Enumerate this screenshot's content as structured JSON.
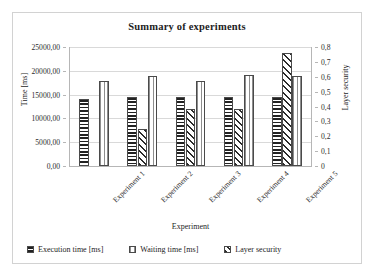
{
  "chart_data": {
    "type": "bar",
    "title": "Summary of experiments",
    "xlabel": "Experiment",
    "ylabel": "Time [ms]",
    "y2label": "Layer security",
    "categories": [
      "Experiment 1",
      "Experiment 2",
      "Experiment 3",
      "Experiment 4",
      "Experiment 5"
    ],
    "series": [
      {
        "name": "Execution time [ms]",
        "axis": "left",
        "pattern": "horizontal-stripes",
        "values": [
          14150,
          14400,
          14400,
          14500,
          14450
        ]
      },
      {
        "name": "Layer security",
        "axis": "right",
        "pattern": "diagonal-stripes",
        "values": [
          0.0,
          0.25,
          0.38,
          0.38,
          0.76
        ]
      },
      {
        "name": "Waiting time [ms]",
        "axis": "left",
        "pattern": "vertical-stripes",
        "values": [
          17850,
          19000,
          17850,
          19150,
          18950
        ]
      }
    ],
    "ylim": [
      0,
      25000
    ],
    "y2lim": [
      0,
      0.8
    ],
    "yticks": [
      "0,00",
      "5000,00",
      "10000,00",
      "15000,00",
      "20000,00",
      "25000,00"
    ],
    "ytick_values": [
      0,
      5000,
      10000,
      15000,
      20000,
      25000
    ],
    "y2ticks": [
      "0",
      "0,1",
      "0,2",
      "0,3",
      "0,4",
      "0,5",
      "0,6",
      "0,7",
      "0,8"
    ],
    "y2tick_values": [
      0,
      0.1,
      0.2,
      0.3,
      0.4,
      0.5,
      0.6,
      0.7,
      0.8
    ],
    "grid": true,
    "legend_position": "bottom",
    "legend": [
      "Execution time [ms]",
      "Waiting time [ms]",
      "Layer security"
    ]
  }
}
